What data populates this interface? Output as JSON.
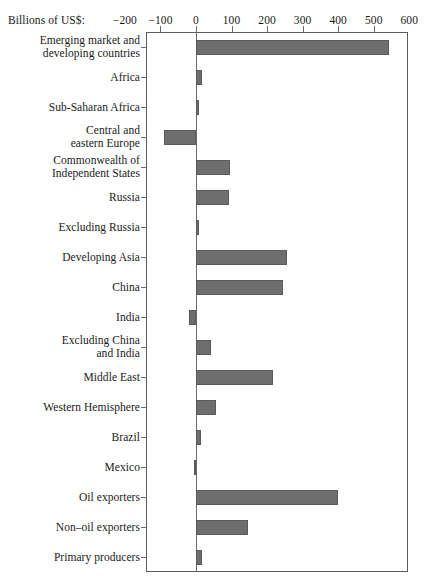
{
  "chart_data": {
    "type": "bar",
    "orientation": "horizontal",
    "title": "",
    "xlabel": "Billions of US$:",
    "ylabel": "",
    "xlim": [
      -200,
      600
    ],
    "xticks": [
      -200,
      -100,
      0,
      100,
      200,
      300,
      400,
      500,
      600
    ],
    "xtick_labels": [
      "−200",
      "−100",
      "0",
      "100",
      "200",
      "300",
      "400",
      "500",
      "600"
    ],
    "grid": false,
    "legend": null,
    "bar_color": "#6e6e6e",
    "bar_edge_color": "#5a5a5a",
    "zero_line_color": "#6b6b6b",
    "frame_color": "#5c5c5c",
    "categories": [
      "Emerging market and developing countries",
      "Africa",
      "Sub-Saharan Africa",
      "Central and eastern Europe",
      "Commonwealth of Independent States",
      "Russia",
      "Excluding Russia",
      "Developing Asia",
      "China",
      "India",
      "Excluding China and India",
      "Middle East",
      "Western Hemisphere",
      "Brazil",
      "Mexico",
      "Oil exporters",
      "Non–oil exporters",
      "Primary producers"
    ],
    "values": [
      543,
      18,
      4,
      -90,
      95,
      93,
      5,
      255,
      245,
      -20,
      42,
      218,
      57,
      15,
      -3,
      400,
      145,
      18
    ]
  },
  "axis": {
    "unit_label": "Billions of US$:",
    "ticks": [
      {
        "value": -200,
        "label": "−200"
      },
      {
        "value": -100,
        "label": "−100"
      },
      {
        "value": 0,
        "label": "0"
      },
      {
        "value": 100,
        "label": "100"
      },
      {
        "value": 200,
        "label": "200"
      },
      {
        "value": 300,
        "label": "300"
      },
      {
        "value": 400,
        "label": "400"
      },
      {
        "value": 500,
        "label": "500"
      },
      {
        "value": 600,
        "label": "600"
      }
    ]
  },
  "rows": [
    {
      "label_line1": "Emerging market and",
      "label_line2": "developing countries",
      "value": 543
    },
    {
      "label_line1": "Africa",
      "label_line2": "",
      "value": 18
    },
    {
      "label_line1": "Sub-Saharan Africa",
      "label_line2": "",
      "value": 4
    },
    {
      "label_line1": "Central and",
      "label_line2": "eastern Europe",
      "value": -90
    },
    {
      "label_line1": "Commonwealth of",
      "label_line2": "Independent States",
      "value": 95
    },
    {
      "label_line1": "Russia",
      "label_line2": "",
      "value": 93
    },
    {
      "label_line1": "Excluding Russia",
      "label_line2": "",
      "value": 5
    },
    {
      "label_line1": "Developing Asia",
      "label_line2": "",
      "value": 255
    },
    {
      "label_line1": "China",
      "label_line2": "",
      "value": 245
    },
    {
      "label_line1": "India",
      "label_line2": "",
      "value": -20
    },
    {
      "label_line1": "Excluding China",
      "label_line2": "and India",
      "value": 42
    },
    {
      "label_line1": "Middle East",
      "label_line2": "",
      "value": 218
    },
    {
      "label_line1": "Western Hemisphere",
      "label_line2": "",
      "value": 57
    },
    {
      "label_line1": "Brazil",
      "label_line2": "",
      "value": 15
    },
    {
      "label_line1": "Mexico",
      "label_line2": "",
      "value": -3
    },
    {
      "label_line1": "Oil exporters",
      "label_line2": "",
      "value": 400
    },
    {
      "label_line1": "Non–oil exporters",
      "label_line2": "",
      "value": 145
    },
    {
      "label_line1": "Primary producers",
      "label_line2": "",
      "value": 18
    }
  ]
}
